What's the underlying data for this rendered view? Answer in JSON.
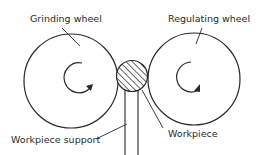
{
  "diagram": {
    "labels": {
      "grinding_wheel": "Grinding wheel",
      "regulating_wheel": "Regulating wheel",
      "workpiece_support": "Workpiece support",
      "workpiece": "Workpiece"
    },
    "colors": {
      "stroke": "#2a2a2a",
      "background": "#ffffff"
    }
  }
}
